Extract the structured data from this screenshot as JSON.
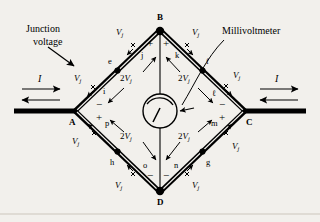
{
  "figure": {
    "background_color": "#f2f0ec",
    "ink_color": "#000000"
  },
  "annotations": {
    "junction_voltage_label_line1": "Junction",
    "junction_voltage_label_line2": "voltage",
    "millivoltmeter_label": "Millivoltmeter",
    "current_left": "I",
    "current_right": "I"
  },
  "nodes": [
    {
      "id": "A",
      "label": "A",
      "x": 75,
      "y": 111
    },
    {
      "id": "B",
      "label": "B",
      "x": 160,
      "y": 30
    },
    {
      "id": "C",
      "label": "C",
      "x": 245,
      "y": 111
    },
    {
      "id": "D",
      "label": "D",
      "x": 160,
      "y": 192
    }
  ],
  "segment_labels": [
    {
      "name": "e",
      "label": "e",
      "x": 112,
      "y": 62
    },
    {
      "name": "j",
      "label": "j",
      "x": 143,
      "y": 56
    },
    {
      "name": "k",
      "label": "k",
      "x": 178,
      "y": 56
    },
    {
      "name": "f",
      "label": "f",
      "x": 208,
      "y": 62
    },
    {
      "name": "i",
      "label": "i",
      "x": 105,
      "y": 92
    },
    {
      "name": "l",
      "label": "ℓ",
      "x": 214,
      "y": 94
    },
    {
      "name": "p",
      "label": "p",
      "x": 107,
      "y": 124
    },
    {
      "name": "m",
      "label": "m",
      "x": 213,
      "y": 124
    },
    {
      "name": "h",
      "label": "h",
      "x": 112,
      "y": 163
    },
    {
      "name": "o",
      "label": "o",
      "x": 145,
      "y": 166
    },
    {
      "name": "n",
      "label": "n",
      "x": 176,
      "y": 166
    },
    {
      "name": "g",
      "label": "g",
      "x": 208,
      "y": 163
    }
  ],
  "vj_labels": [
    {
      "name": "vj-ab-outer",
      "text": "V",
      "sub": "j",
      "x": 119,
      "y": 33
    },
    {
      "name": "vj-bc-outer",
      "text": "V",
      "sub": "j",
      "x": 192,
      "y": 33
    },
    {
      "name": "vj-ab-lower",
      "text": "V",
      "sub": "j",
      "x": 78,
      "y": 79
    },
    {
      "name": "vj-bc-lower",
      "text": "V",
      "sub": "j",
      "x": 233,
      "y": 76
    },
    {
      "name": "vj-ad-upper",
      "text": "V",
      "sub": "j",
      "x": 76,
      "y": 141
    },
    {
      "name": "vj-cd-upper",
      "text": "V",
      "sub": "j",
      "x": 232,
      "y": 146
    },
    {
      "name": "vj-ad-lower",
      "text": "V",
      "sub": "j",
      "x": 118,
      "y": 186
    },
    {
      "name": "vj-cd-lower",
      "text": "V",
      "sub": "j",
      "x": 192,
      "y": 186
    }
  ],
  "two_vj_labels": [
    {
      "name": "two-vj-upper-left",
      "coef": "2",
      "text": "V",
      "sub": "j",
      "x": 126,
      "y": 79
    },
    {
      "name": "two-vj-upper-right",
      "coef": "2",
      "text": "V",
      "sub": "j",
      "x": 184,
      "y": 79
    },
    {
      "name": "two-vj-lower-left",
      "coef": "2",
      "text": "V",
      "sub": "j",
      "x": 126,
      "y": 137
    },
    {
      "name": "two-vj-lower-right",
      "coef": "2",
      "text": "V",
      "sub": "j",
      "x": 184,
      "y": 137
    }
  ],
  "polarity_marks": [
    {
      "name": "plus-b-left",
      "sign": "+",
      "x": 150,
      "y": 44
    },
    {
      "name": "plus-b-right",
      "sign": "+",
      "x": 166,
      "y": 44
    },
    {
      "name": "minus-a",
      "sign": "−",
      "x": 99,
      "y": 105
    },
    {
      "name": "plus-a",
      "sign": "+",
      "x": 99,
      "y": 118
    },
    {
      "name": "minus-c",
      "sign": "−",
      "x": 221,
      "y": 105
    },
    {
      "name": "plus-c",
      "sign": "+",
      "x": 221,
      "y": 118
    },
    {
      "name": "minus-d-left",
      "sign": "−",
      "x": 150,
      "y": 176
    },
    {
      "name": "minus-d-right",
      "sign": "−",
      "x": 166,
      "y": 176
    }
  ],
  "meter": {
    "name": "millivoltmeter",
    "cx": 160,
    "cy": 111,
    "r": 17,
    "needle_angle_deg": 250
  }
}
